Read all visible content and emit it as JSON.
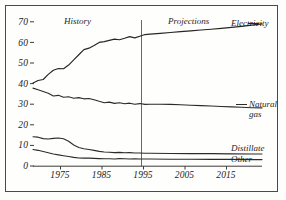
{
  "chart_data": {
    "type": "line",
    "title": "",
    "subtitle": "",
    "xlabel": "",
    "ylabel": "",
    "xlim": [
      1972,
      2017
    ],
    "ylim": [
      0,
      72
    ],
    "grid": false,
    "legend_position": "right-inline",
    "xticks": [
      "1975",
      "1985",
      "1995",
      "2005",
      "2015"
    ],
    "xtick_values": [
      1975,
      1985,
      1995,
      2005,
      2015
    ],
    "yticks": [
      "0",
      "10",
      "20",
      "30",
      "40",
      "50",
      "60",
      "70"
    ],
    "ytick_values": [
      0,
      10,
      20,
      30,
      40,
      50,
      60,
      70
    ],
    "annotations": [
      {
        "text": "History",
        "x": 1980,
        "y": 70
      },
      {
        "text": "Projections",
        "x": 2003,
        "y": 70
      }
    ],
    "divider": {
      "x": 1994,
      "label": "history-projection-divider"
    },
    "series": [
      {
        "name": "Electricity",
        "label_lines": [
          "Electricity"
        ],
        "color": "#262625",
        "x": [
          1972,
          1973,
          1974,
          1975,
          1976,
          1977,
          1978,
          1979,
          1980,
          1981,
          1982,
          1983,
          1984,
          1985,
          1986,
          1987,
          1988,
          1989,
          1990,
          1991,
          1992,
          1993,
          1994,
          1995,
          1997,
          1999,
          2001,
          2003,
          2005,
          2007,
          2009,
          2011,
          2013,
          2015,
          2017
        ],
        "values": [
          40.3,
          41.5,
          42.0,
          44.5,
          46.5,
          47.3,
          47.2,
          49.0,
          51.5,
          54.0,
          56.5,
          57.2,
          58.5,
          60.0,
          60.4,
          61.0,
          61.6,
          61.3,
          62.0,
          62.8,
          62.2,
          63.0,
          63.8,
          64.0,
          64.4,
          64.8,
          65.2,
          65.6,
          66.0,
          66.4,
          66.8,
          67.3,
          67.8,
          68.4,
          69.0
        ]
      },
      {
        "name": "Natural gas",
        "label_lines": [
          "Natural",
          "gas"
        ],
        "color": "#2b2b2a",
        "x": [
          1972,
          1973,
          1974,
          1975,
          1976,
          1977,
          1978,
          1979,
          1980,
          1981,
          1982,
          1983,
          1984,
          1985,
          1986,
          1987,
          1988,
          1989,
          1990,
          1991,
          1992,
          1993,
          1994,
          1995,
          1997,
          1999,
          2001,
          2003,
          2005,
          2007,
          2009,
          2011,
          2013,
          2015,
          2017
        ],
        "values": [
          37.8,
          37.0,
          36.2,
          35.3,
          34.0,
          34.3,
          33.4,
          33.6,
          32.9,
          33.2,
          32.6,
          32.8,
          32.2,
          31.4,
          30.7,
          31.0,
          30.4,
          30.7,
          30.2,
          30.5,
          30.0,
          30.3,
          29.9,
          30.0,
          30.0,
          29.9,
          29.7,
          29.5,
          29.3,
          29.1,
          28.9,
          28.7,
          28.5,
          28.3,
          28.2
        ]
      },
      {
        "name": "Distillate",
        "label_lines": [
          "Distillate"
        ],
        "color": "#2b2b2a",
        "x": [
          1972,
          1973,
          1974,
          1975,
          1976,
          1977,
          1978,
          1979,
          1980,
          1981,
          1982,
          1983,
          1984,
          1985,
          1986,
          1987,
          1988,
          1989,
          1990,
          1991,
          1992,
          1993,
          1994,
          1995,
          1999,
          2003,
          2007,
          2011,
          2015,
          2017
        ],
        "values": [
          14.2,
          14.0,
          13.3,
          13.1,
          13.4,
          13.6,
          13.2,
          12.0,
          10.2,
          9.0,
          8.4,
          8.0,
          7.6,
          7.1,
          6.8,
          6.7,
          6.5,
          6.6,
          6.4,
          6.5,
          6.3,
          6.3,
          6.2,
          6.2,
          6.1,
          6.0,
          6.0,
          5.9,
          5.8,
          5.8
        ]
      },
      {
        "name": "Other",
        "label_lines": [
          "Other"
        ],
        "color": "#2b2b2a",
        "x": [
          1972,
          1973,
          1974,
          1975,
          1976,
          1977,
          1978,
          1979,
          1980,
          1981,
          1982,
          1983,
          1984,
          1985,
          1986,
          1987,
          1988,
          1989,
          1990,
          1991,
          1992,
          1993,
          1994,
          1995,
          1999,
          2003,
          2007,
          2011,
          2015,
          2017
        ],
        "values": [
          8.0,
          7.6,
          7.0,
          6.4,
          5.8,
          5.4,
          5.0,
          4.6,
          4.2,
          3.9,
          3.8,
          3.8,
          3.7,
          3.6,
          3.5,
          3.5,
          3.4,
          3.6,
          3.5,
          3.4,
          3.5,
          3.4,
          3.4,
          3.4,
          3.3,
          3.3,
          3.2,
          3.2,
          3.1,
          3.1
        ]
      }
    ]
  },
  "labels": {
    "history": "History",
    "projections": "Projections",
    "electricity": "Electricity",
    "natural_1": "Natural",
    "natural_2": "gas",
    "distillate": "Distillate",
    "other": "Other"
  },
  "yticks": {
    "t70": "70",
    "t60": "60",
    "t50": "50",
    "t40": "40",
    "t30": "30",
    "t20": "20",
    "t10": "10",
    "t0": "0"
  },
  "xticks": {
    "t1975": "1975",
    "t1985": "1985",
    "t1995": "1995",
    "t2005": "2005",
    "t2015": "2015"
  }
}
